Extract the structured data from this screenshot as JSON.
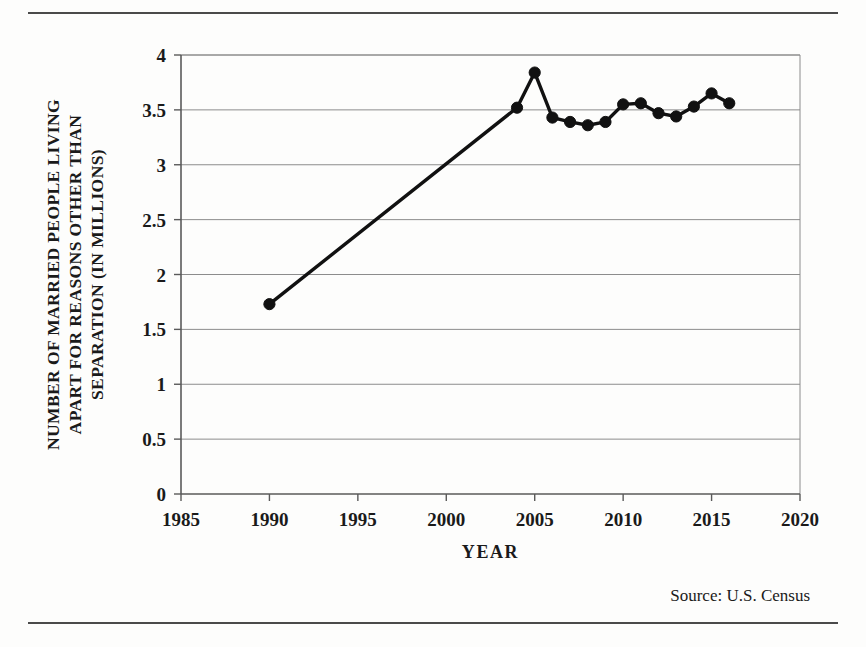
{
  "figure": {
    "source_note": "Source:  U.S. Census",
    "rules": {
      "top": true,
      "bottom": true
    }
  },
  "chart_data": {
    "type": "line",
    "title": "",
    "subtitle": "",
    "xlabel": "YEAR",
    "ylabel": "NUMBER OF MARRIED PEOPLE LIVING APART FOR REASONS OTHER THAN SEPARATION (IN MILLIONS)",
    "ylabel_lines": [
      "NUMBER OF MARRIED PEOPLE LIVING",
      "APART FOR REASONS OTHER THAN",
      "SEPARATION (IN MILLIONS)"
    ],
    "xlim": [
      1985,
      2020
    ],
    "ylim": [
      0,
      4
    ],
    "xticks": [
      1985,
      1990,
      1995,
      2000,
      2005,
      2010,
      2015,
      2020
    ],
    "xtick_labels": [
      "1985",
      "1990",
      "1995",
      "2000",
      "2005",
      "2010",
      "2015",
      "2020"
    ],
    "yticks": [
      0,
      0.5,
      1,
      1.5,
      2,
      2.5,
      3,
      3.5,
      4
    ],
    "ytick_labels": [
      "0",
      "0.5",
      "1",
      "1.5",
      "2",
      "2.5",
      "3",
      "3.5",
      "4"
    ],
    "grid": "horizontal",
    "legend": "none",
    "marker": "circle",
    "line_color": "#111111",
    "marker_color": "#111111",
    "series": [
      {
        "name": "Married people living apart (millions)",
        "x": [
          1990,
          2004,
          2005,
          2006,
          2007,
          2008,
          2009,
          2010,
          2011,
          2012,
          2013,
          2014,
          2015,
          2016
        ],
        "values": [
          1.73,
          3.52,
          3.84,
          3.43,
          3.39,
          3.36,
          3.39,
          3.55,
          3.56,
          3.47,
          3.44,
          3.53,
          3.65,
          3.56
        ]
      }
    ],
    "annotations": []
  }
}
